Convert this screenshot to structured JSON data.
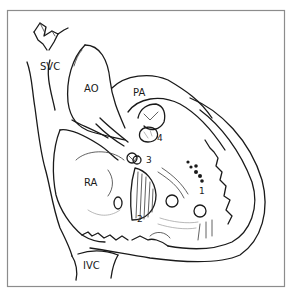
{
  "diagram": {
    "type": "anatomical line drawing",
    "labels": {
      "svc": "SVC",
      "ao": "AO",
      "pa": "PA",
      "ra": "RA",
      "ivc": "IVC"
    },
    "markers": {
      "m1": "1",
      "m2": "2",
      "m3": "3",
      "m4": "4"
    },
    "colors": {
      "ink": "#1a1a1a",
      "frame": "#8c8c8c",
      "background": "#ffffff"
    }
  }
}
